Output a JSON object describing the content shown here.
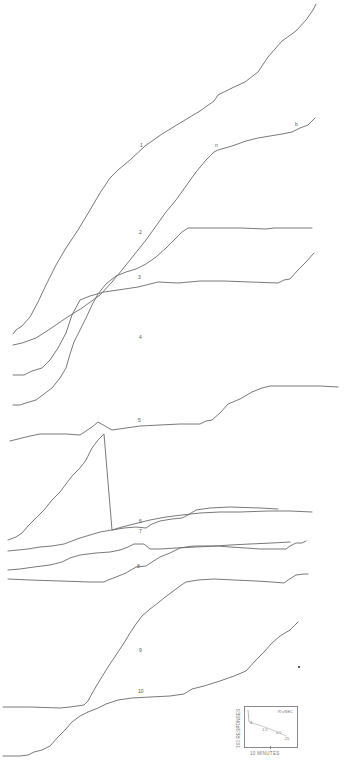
{
  "chart_data": {
    "type": "line",
    "title": "",
    "xlabel": "10 MINUTES",
    "ylabel": "300 RESPONSES",
    "grid": false,
    "legend": "none",
    "coordinate_space": "pixels (x right, y down) of a 348x764 figure",
    "series": [
      {
        "name": "1",
        "label_pos": [
          140,
          146
        ],
        "points": [
          [
            13,
            334
          ],
          [
            16,
            330
          ],
          [
            22,
            326
          ],
          [
            30,
            317
          ],
          [
            38,
            302
          ],
          [
            46,
            285
          ],
          [
            56,
            265
          ],
          [
            66,
            248
          ],
          [
            78,
            230
          ],
          [
            90,
            210
          ],
          [
            100,
            193
          ],
          [
            110,
            178
          ],
          [
            118,
            170
          ],
          [
            130,
            160
          ],
          [
            145,
            146
          ],
          [
            162,
            134
          ],
          [
            180,
            123
          ],
          [
            200,
            111
          ],
          [
            214,
            101
          ],
          [
            218,
            95
          ],
          [
            232,
            88
          ],
          [
            245,
            82
          ],
          [
            258,
            72
          ],
          [
            268,
            57
          ],
          [
            282,
            41
          ],
          [
            296,
            31
          ],
          [
            306,
            20
          ],
          [
            313,
            10
          ],
          [
            316,
            4
          ]
        ]
      },
      {
        "name": "2",
        "label_pos": [
          139,
          233
        ],
        "points": [
          [
            13,
            345
          ],
          [
            22,
            343
          ],
          [
            36,
            338
          ],
          [
            50,
            329
          ],
          [
            66,
            318
          ],
          [
            82,
            308
          ],
          [
            100,
            295
          ],
          [
            112,
            282
          ],
          [
            122,
            270
          ],
          [
            134,
            255
          ],
          [
            146,
            240
          ],
          [
            156,
            226
          ],
          [
            166,
            212
          ],
          [
            176,
            200
          ],
          [
            186,
            186
          ],
          [
            196,
            172
          ],
          [
            206,
            160
          ],
          [
            214,
            152
          ],
          [
            218,
            150
          ],
          [
            232,
            146
          ],
          [
            246,
            141
          ],
          [
            258,
            138
          ],
          [
            270,
            136
          ],
          [
            282,
            134
          ],
          [
            292,
            132
          ],
          [
            300,
            128
          ],
          [
            308,
            125
          ],
          [
            315,
            118
          ]
        ]
      },
      {
        "name": "3",
        "label_pos": [
          138,
          278
        ],
        "points": [
          [
            13,
            375
          ],
          [
            24,
            375
          ],
          [
            32,
            371
          ],
          [
            42,
            368
          ],
          [
            50,
            360
          ],
          [
            58,
            348
          ],
          [
            66,
            333
          ],
          [
            72,
            315
          ],
          [
            80,
            300
          ],
          [
            90,
            296
          ],
          [
            104,
            292
          ],
          [
            118,
            290
          ],
          [
            138,
            287
          ],
          [
            158,
            282
          ],
          [
            178,
            283
          ],
          [
            200,
            281
          ],
          [
            224,
            281
          ],
          [
            250,
            282
          ],
          [
            278,
            283
          ],
          [
            284,
            280
          ],
          [
            290,
            279
          ],
          [
            298,
            270
          ],
          [
            306,
            262
          ],
          [
            314,
            253
          ]
        ]
      },
      {
        "name": "4",
        "label_pos": [
          139,
          338
        ],
        "points": [
          [
            13,
            405
          ],
          [
            20,
            405
          ],
          [
            26,
            403
          ],
          [
            36,
            400
          ],
          [
            44,
            394
          ],
          [
            52,
            388
          ],
          [
            60,
            378
          ],
          [
            66,
            368
          ],
          [
            70,
            354
          ],
          [
            74,
            342
          ],
          [
            80,
            330
          ],
          [
            86,
            318
          ],
          [
            92,
            305
          ],
          [
            98,
            294
          ],
          [
            106,
            284
          ],
          [
            116,
            276
          ],
          [
            126,
            272
          ],
          [
            136,
            269
          ],
          [
            146,
            264
          ],
          [
            156,
            257
          ],
          [
            166,
            248
          ],
          [
            174,
            240
          ],
          [
            182,
            232
          ],
          [
            188,
            228
          ],
          [
            200,
            228
          ],
          [
            218,
            228
          ],
          [
            240,
            228
          ],
          [
            266,
            229
          ],
          [
            274,
            228
          ],
          [
            292,
            228
          ],
          [
            312,
            228
          ]
        ]
      },
      {
        "name": "5",
        "label_pos": [
          138,
          421
        ],
        "points": [
          [
            10,
            441
          ],
          [
            18,
            439
          ],
          [
            30,
            436
          ],
          [
            40,
            434
          ],
          [
            52,
            434
          ],
          [
            66,
            434
          ],
          [
            80,
            435
          ],
          [
            86,
            431
          ],
          [
            92,
            427
          ],
          [
            98,
            422
          ],
          [
            112,
            430
          ],
          [
            126,
            428
          ],
          [
            140,
            426
          ],
          [
            160,
            425
          ],
          [
            180,
            424
          ],
          [
            200,
            424
          ],
          [
            206,
            421
          ],
          [
            212,
            420
          ],
          [
            220,
            413
          ],
          [
            228,
            404
          ],
          [
            240,
            399
          ],
          [
            252,
            392
          ],
          [
            262,
            388
          ],
          [
            270,
            386
          ],
          [
            282,
            386
          ],
          [
            300,
            386
          ],
          [
            320,
            386
          ],
          [
            338,
            387
          ]
        ]
      },
      {
        "name": "6",
        "label_pos": [
          139,
          522
        ],
        "points": [
          [
            8,
            540
          ],
          [
            16,
            537
          ],
          [
            22,
            533
          ],
          [
            28,
            526
          ],
          [
            36,
            518
          ],
          [
            44,
            510
          ],
          [
            52,
            500
          ],
          [
            60,
            492
          ],
          [
            66,
            484
          ],
          [
            72,
            476
          ],
          [
            80,
            468
          ],
          [
            86,
            460
          ],
          [
            92,
            448
          ],
          [
            98,
            440
          ],
          [
            104,
            434
          ],
          [
            112,
            530
          ],
          [
            124,
            528
          ],
          [
            136,
            527
          ],
          [
            146,
            528
          ],
          [
            152,
            524
          ],
          [
            160,
            521
          ],
          [
            172,
            519
          ],
          [
            182,
            518
          ],
          [
            188,
            515
          ],
          [
            196,
            510
          ],
          [
            210,
            508
          ],
          [
            230,
            507
          ],
          [
            260,
            508
          ],
          [
            278,
            509
          ]
        ]
      },
      {
        "name": "7",
        "label_pos": [
          139,
          532
        ],
        "points": [
          [
            8,
            551
          ],
          [
            18,
            550
          ],
          [
            28,
            549
          ],
          [
            40,
            547
          ],
          [
            52,
            546
          ],
          [
            64,
            544
          ],
          [
            72,
            541
          ],
          [
            80,
            538
          ],
          [
            90,
            535
          ],
          [
            100,
            532
          ],
          [
            112,
            530
          ],
          [
            122,
            527
          ],
          [
            134,
            524
          ],
          [
            150,
            520
          ],
          [
            166,
            517
          ],
          [
            182,
            515
          ],
          [
            200,
            513
          ],
          [
            220,
            512
          ],
          [
            240,
            512
          ],
          [
            268,
            511
          ],
          [
            290,
            511
          ],
          [
            312,
            512
          ]
        ]
      },
      {
        "name": "8",
        "label_pos": [
          137,
          567
        ],
        "points": [
          [
            8,
            570
          ],
          [
            20,
            569
          ],
          [
            34,
            567
          ],
          [
            50,
            565
          ],
          [
            62,
            562
          ],
          [
            70,
            558
          ],
          [
            80,
            555
          ],
          [
            96,
            553
          ],
          [
            110,
            552
          ],
          [
            120,
            550
          ],
          [
            128,
            547
          ],
          [
            134,
            544
          ],
          [
            144,
            544
          ],
          [
            150,
            549
          ],
          [
            160,
            549
          ],
          [
            176,
            548
          ],
          [
            196,
            547
          ],
          [
            216,
            546
          ],
          [
            230,
            545
          ],
          [
            250,
            544
          ],
          [
            272,
            543
          ],
          [
            290,
            542
          ]
        ]
      },
      {
        "name": "9",
        "label_pos": [
          139,
          651
        ],
        "points": [
          [
            8,
            579
          ],
          [
            30,
            580
          ],
          [
            60,
            581
          ],
          [
            90,
            582
          ],
          [
            104,
            582
          ],
          [
            108,
            580
          ],
          [
            116,
            577
          ],
          [
            126,
            573
          ],
          [
            136,
            567
          ],
          [
            146,
            566
          ],
          [
            152,
            562
          ],
          [
            160,
            557
          ],
          [
            170,
            553
          ],
          [
            180,
            548
          ],
          [
            186,
            547
          ],
          [
            194,
            546
          ],
          [
            204,
            546
          ],
          [
            218,
            546
          ],
          [
            230,
            547
          ],
          [
            246,
            548
          ],
          [
            260,
            549
          ],
          [
            270,
            549
          ],
          [
            286,
            549
          ],
          [
            290,
            546
          ],
          [
            296,
            543
          ],
          [
            302,
            543
          ],
          [
            306,
            541
          ]
        ]
      },
      {
        "name": "10",
        "label_pos": [
          138,
          692
        ],
        "points": [
          [
            3,
            756
          ],
          [
            20,
            756
          ],
          [
            28,
            755
          ],
          [
            34,
            752
          ],
          [
            42,
            750
          ],
          [
            50,
            746
          ],
          [
            58,
            737
          ],
          [
            66,
            729
          ],
          [
            72,
            722
          ],
          [
            80,
            716
          ],
          [
            88,
            712
          ],
          [
            98,
            708
          ],
          [
            106,
            704
          ],
          [
            118,
            700
          ],
          [
            132,
            698
          ],
          [
            150,
            697
          ],
          [
            170,
            696
          ],
          [
            184,
            694
          ],
          [
            192,
            689
          ],
          [
            204,
            686
          ],
          [
            220,
            681
          ],
          [
            234,
            676
          ],
          [
            246,
            671
          ],
          [
            256,
            660
          ],
          [
            264,
            652
          ],
          [
            272,
            643
          ],
          [
            280,
            636
          ],
          [
            290,
            630
          ],
          [
            298,
            622
          ]
        ]
      },
      {
        "name": "9-main",
        "label_pos": null,
        "points": [
          [
            3,
            707
          ],
          [
            30,
            707
          ],
          [
            60,
            708
          ],
          [
            70,
            707
          ],
          [
            84,
            705
          ],
          [
            88,
            701
          ],
          [
            94,
            690
          ],
          [
            100,
            680
          ],
          [
            108,
            667
          ],
          [
            116,
            655
          ],
          [
            124,
            643
          ],
          [
            130,
            633
          ],
          [
            136,
            624
          ],
          [
            142,
            616
          ],
          [
            150,
            609
          ],
          [
            158,
            603
          ],
          [
            164,
            598
          ],
          [
            172,
            592
          ],
          [
            180,
            586
          ],
          [
            186,
            582
          ],
          [
            198,
            580
          ],
          [
            214,
            579
          ],
          [
            234,
            580
          ],
          [
            256,
            581
          ],
          [
            272,
            582
          ],
          [
            284,
            583
          ],
          [
            288,
            580
          ],
          [
            296,
            575
          ],
          [
            304,
            574
          ],
          [
            308,
            574
          ]
        ]
      }
    ],
    "labels": [
      "1",
      "2",
      "3",
      "4",
      "5",
      "6",
      "7",
      "8",
      "9",
      "10"
    ],
    "small_annotations": [
      {
        "text": "n",
        "pos": [
          215,
          146
        ]
      },
      {
        "text": "b",
        "pos": [
          295,
          125
        ]
      }
    ],
    "inset": {
      "ylabel": "300 RESPONSES",
      "xlabel": "10 MINUTES",
      "unit": "R's/SEC",
      "rates": [
        "4",
        "1.5",
        "0.5",
        ".25"
      ]
    }
  }
}
